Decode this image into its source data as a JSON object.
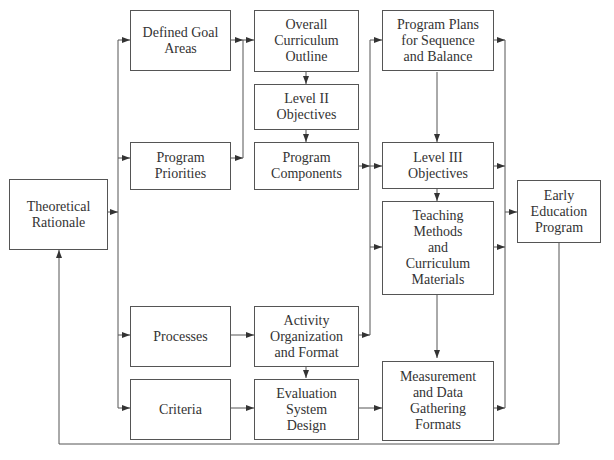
{
  "diagram": {
    "type": "flowchart",
    "cut_off_top_text": "",
    "line_color": "#555555",
    "boxes": {
      "theoretical_rationale": "Theoretical\nRationale",
      "defined_goal_areas": "Defined Goal\nAreas",
      "program_priorities": "Program\nPriorities",
      "processes": "Processes",
      "criteria": "Criteria",
      "overall_curriculum_outline": "Overall\nCurriculum\nOutline",
      "level_ii_objectives": "Level II\nObjectives",
      "program_components": "Program\nComponents",
      "activity_organization": "Activity\nOrganization\nand Format",
      "evaluation_system_design": "Evaluation\nSystem\nDesign",
      "program_plans": "Program Plans\nfor Sequence\nand Balance",
      "level_iii_objectives": "Level III\nObjectives",
      "teaching_methods": "Teaching\nMethods\nand\nCurriculum\nMaterials",
      "measurement_formats": "Measurement\nand Data\nGathering\nFormats",
      "early_education_program": "Early\nEducation\nProgram"
    },
    "edges": [
      [
        "Theoretical Rationale",
        "Defined Goal Areas"
      ],
      [
        "Theoretical Rationale",
        "Program Priorities"
      ],
      [
        "Theoretical Rationale",
        "Processes"
      ],
      [
        "Theoretical Rationale",
        "Criteria"
      ],
      [
        "Defined Goal Areas",
        "Overall Curriculum Outline"
      ],
      [
        "Program Priorities",
        "Overall Curriculum Outline"
      ],
      [
        "Overall Curriculum Outline",
        "Level II Objectives"
      ],
      [
        "Level II Objectives",
        "Program Components"
      ],
      [
        "Program Components",
        "Program Plans for Sequence and Balance"
      ],
      [
        "Program Components",
        "Level III Objectives"
      ],
      [
        "Program Components",
        "Teaching Methods and Curriculum Materials"
      ],
      [
        "Activity Organization and Format",
        "Program Plans for Sequence and Balance"
      ],
      [
        "Processes",
        "Activity Organization and Format"
      ],
      [
        "Activity Organization and Format",
        "Evaluation System Design"
      ],
      [
        "Criteria",
        "Evaluation System Design"
      ],
      [
        "Evaluation System Design",
        "Measurement and Data Gathering Formats"
      ],
      [
        "Program Plans for Sequence and Balance",
        "Level III Objectives"
      ],
      [
        "Level III Objectives",
        "Teaching Methods and Curriculum Materials"
      ],
      [
        "Teaching Methods and Curriculum Materials",
        "Measurement and Data Gathering Formats"
      ],
      [
        "Program Plans for Sequence and Balance",
        "Early Education Program"
      ],
      [
        "Level III Objectives",
        "Early Education Program"
      ],
      [
        "Teaching Methods and Curriculum Materials",
        "Early Education Program"
      ],
      [
        "Measurement and Data Gathering Formats",
        "Early Education Program"
      ],
      [
        "Early Education Program",
        "Theoretical Rationale"
      ]
    ]
  }
}
